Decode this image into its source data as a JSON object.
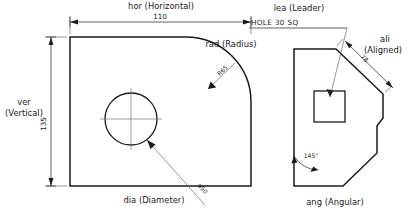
{
  "drawing": {
    "title": "Dimension style examples",
    "background_color": "#ffffff",
    "line_color": "#1a1a1a",
    "dim_color": "#3a3a3a"
  },
  "left_part": {
    "horizontal_dim": {
      "label": "hor  (Horizontal)",
      "value": "110"
    },
    "vertical_dim": {
      "label_line1": "ver",
      "label_line2": "(Vertical)",
      "value": "135"
    },
    "radius_dim": {
      "label": "rad  (Radius)",
      "value": "R65"
    },
    "diameter_dim": {
      "label": "dia  (Diameter)",
      "value": "ø50"
    }
  },
  "right_part": {
    "leader_dim": {
      "label": "lea  (Leader)",
      "note": "HOLE 30 SQ"
    },
    "aligned_dim": {
      "label_line1": "ali",
      "label_line2": "(Aligned)",
      "value": "78"
    },
    "angular_dim": {
      "label": "ang  (Angular)",
      "value": "145°"
    }
  }
}
